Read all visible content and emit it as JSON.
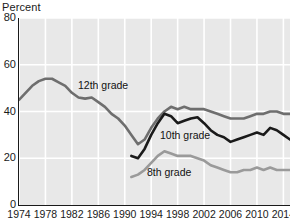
{
  "chart_data": {
    "type": "line",
    "title": "",
    "ylabel": "Percent",
    "xlabel": "",
    "ylim": [
      0,
      80
    ],
    "xlim": [
      1974,
      2015
    ],
    "grid": true,
    "legend_position": "inline-labels",
    "y_ticks": [
      "80",
      "60",
      "40",
      "20",
      "0"
    ],
    "y_tick_values": [
      80,
      60,
      40,
      20,
      0
    ],
    "x_ticks": [
      "1974",
      "1978",
      "1982",
      "1986",
      "1990",
      "1994",
      "1998",
      "2002",
      "2006",
      "2010",
      "2014"
    ],
    "x_tick_values": [
      1974,
      1978,
      1982,
      1986,
      1990,
      1994,
      1998,
      2002,
      2006,
      2010,
      2014
    ],
    "series": [
      {
        "name": "12th grade",
        "color": "#6e6e6e",
        "x": [
          1974,
          1975,
          1976,
          1977,
          1978,
          1979,
          1980,
          1981,
          1982,
          1983,
          1984,
          1985,
          1986,
          1987,
          1988,
          1989,
          1990,
          1991,
          1992,
          1993,
          1994,
          1995,
          1996,
          1997,
          1998,
          1999,
          2000,
          2001,
          2002,
          2003,
          2004,
          2005,
          2006,
          2007,
          2008,
          2009,
          2010,
          2011,
          2012,
          2013,
          2014,
          2015
        ],
        "values": [
          45,
          48,
          51,
          53,
          54,
          54,
          52.5,
          51,
          48,
          46,
          45.5,
          46,
          44,
          42,
          39,
          37,
          34,
          30,
          26,
          28,
          33,
          37,
          40,
          42,
          41,
          42,
          41,
          41,
          41,
          40,
          39,
          38,
          37,
          37,
          37,
          38,
          39,
          39,
          40,
          40,
          39,
          39
        ]
      },
      {
        "name": "10th grade",
        "color": "#1a1a1a",
        "x": [
          1991,
          1992,
          1993,
          1994,
          1995,
          1996,
          1997,
          1998,
          1999,
          2000,
          2001,
          2002,
          2003,
          2004,
          2005,
          2006,
          2007,
          2008,
          2009,
          2010,
          2011,
          2012,
          2013,
          2014,
          2015
        ],
        "values": [
          21,
          20,
          24,
          30,
          35,
          39,
          38,
          35,
          36,
          37,
          37.5,
          35,
          32,
          30,
          29,
          27,
          28,
          29,
          30,
          31,
          30,
          33,
          32,
          30,
          28
        ]
      },
      {
        "name": "8th grade",
        "color": "#9a9a9a",
        "x": [
          1991,
          1992,
          1993,
          1994,
          1995,
          1996,
          1997,
          1998,
          1999,
          2000,
          2001,
          2002,
          2003,
          2004,
          2005,
          2006,
          2007,
          2008,
          2009,
          2010,
          2011,
          2012,
          2013,
          2014,
          2015
        ],
        "values": [
          12,
          13,
          15,
          18,
          21,
          23,
          22,
          21,
          21,
          21,
          20,
          19,
          17,
          16,
          15,
          14,
          14,
          15,
          15,
          16,
          15,
          16,
          15,
          15,
          15
        ]
      }
    ]
  },
  "labels": {
    "grade12": "12th grade",
    "grade10": "10th grade",
    "grade8": "8th grade"
  },
  "colors": {
    "plot_background": "#e8e8e8",
    "gridline": "#ffffff",
    "axis": "#1a1a1a",
    "grade12": "#6e6e6e",
    "grade10": "#1a1a1a",
    "grade8": "#9a9a9a"
  }
}
